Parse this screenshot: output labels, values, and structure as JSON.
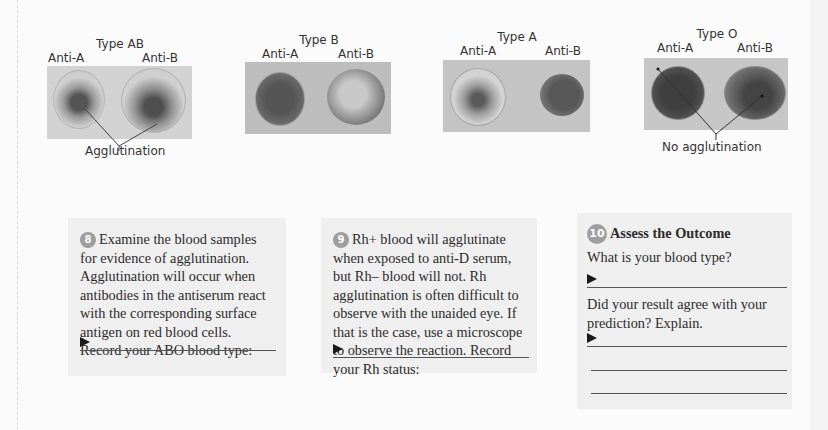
{
  "figures": [
    {
      "title": "Type AB",
      "left_label": "Anti-A",
      "right_label": "Anti-B",
      "caption": "Agglutination",
      "left_state": "agglutinated",
      "right_state": "agglutinated"
    },
    {
      "title": "Type B",
      "left_label": "Anti-A",
      "right_label": "Anti-B",
      "caption": "",
      "left_state": "smooth",
      "right_state": "agglutinated"
    },
    {
      "title": "Type A",
      "left_label": "Anti-A",
      "right_label": "Anti-B",
      "caption": "",
      "left_state": "agglutinated",
      "right_state": "smooth"
    },
    {
      "title": "Type O",
      "left_label": "Anti-A",
      "right_label": "Anti-B",
      "caption": "No agglutination",
      "left_state": "smooth",
      "right_state": "smooth"
    }
  ],
  "steps": [
    {
      "number": "8",
      "text": "Examine the blood samples for evidence of agglutination. Agglutination will occur when antibodies in the antiserum react with the corresponding surface antigen on red blood cells. Record your ABO blood type:",
      "answer": ""
    },
    {
      "number": "9",
      "text": "Rh+ blood will agglutinate when exposed to anti-D serum, but Rh– blood will not. Rh agglutination is often difficult to observe with the unaided eye. If that is the case, use a microscope to observe the reaction. Record your Rh status:",
      "answer": ""
    },
    {
      "number": "10",
      "heading": "Assess the Outcome",
      "question1": "What is your blood type?",
      "answer1": "",
      "question2": "Did your result agree with your prediction? Explain.",
      "answer2": ""
    }
  ],
  "colors": {
    "photo_bg": "#bdbdbd",
    "box_bg": "#efefef",
    "badge": "#9e9e9e"
  }
}
